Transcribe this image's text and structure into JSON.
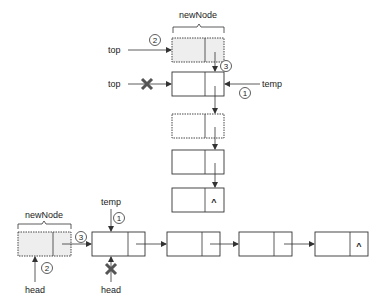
{
  "stack_diagram": {
    "new_node_label": "newNode",
    "top_label_new": "top",
    "top_label_old": "top",
    "temp_label": "temp",
    "step_1": "1",
    "step_2": "2",
    "step_3": "3",
    "null_symbol": "^",
    "node_count": 5
  },
  "queue_diagram": {
    "new_node_label": "newNode",
    "temp_label": "temp",
    "head_label_new": "head",
    "head_label_old": "head",
    "step_1": "1",
    "step_2": "2",
    "step_3": "3",
    "null_symbol": "^",
    "node_count": 5
  },
  "colors": {
    "line": "#333333",
    "shaded_fill": "#eeeeee",
    "x_mark": "#555555"
  }
}
